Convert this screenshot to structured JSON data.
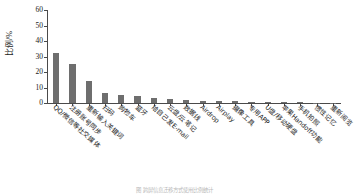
{
  "chart_data": {
    "type": "bar",
    "title": "",
    "xlabel": "",
    "ylabel": "比例/%",
    "ylim": [
      0,
      60
    ],
    "yticks": [
      0,
      10,
      20,
      30,
      40,
      50,
      60
    ],
    "grid": false,
    "legend": false,
    "bar_color": "#6e6e6e",
    "categories": [
      "QQ/微信等社交媒体",
      "注册账号同步",
      "重新输入关键词",
      "扫码",
      "购物车",
      "蓝牙",
      "给自己发E-mail",
      "云盘/云笔记",
      "数据线",
      "Airdrop",
      "Airplay",
      "摄像工具",
      "专用APP",
      "U盘/移动硬盘",
      "苹果Handoff功能",
      "手机拍照",
      "惯性记忆",
      "重新阅览"
    ],
    "values": [
      32,
      25.2,
      14.5,
      6.5,
      5.2,
      4.6,
      3.0,
      2.4,
      2.0,
      1.6,
      1.3,
      1.0,
      0.8,
      0.6,
      0.5,
      0.4,
      0.3,
      0.2
    ]
  },
  "caption": {
    "text": "图 跨屏信息迁移方式使用比例统计"
  }
}
